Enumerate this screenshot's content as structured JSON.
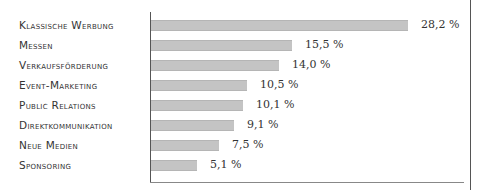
{
  "chart_data": {
    "type": "bar",
    "orientation": "horizontal",
    "title": "",
    "xlabel": "",
    "ylabel": "",
    "unit": "%",
    "categories": [
      "Klassische Werbung",
      "Messen",
      "Verkaufsförderung",
      "Event-Marketing",
      "Public Relations",
      "Direktkommunikation",
      "Neue Medien",
      "Sponsoring"
    ],
    "values": [
      28.2,
      15.5,
      14.0,
      10.5,
      10.1,
      9.1,
      7.5,
      5.1
    ],
    "value_labels": [
      "28,2 %",
      "15,5 %",
      "14,0 %",
      "10,5 %",
      "10,1 %",
      "9,1 %",
      "7,5 %",
      "5,1 %"
    ],
    "xlim": [
      0,
      35
    ],
    "grid": false,
    "legend": null,
    "bar_color": "#c4c4c4"
  },
  "rows": [
    {
      "label": "Klassische Werbung",
      "value": "28,2 %"
    },
    {
      "label": "Messen",
      "value": "15,5 %"
    },
    {
      "label": "Verkaufsförderung",
      "value": "14,0 %"
    },
    {
      "label": "Event-Marketing",
      "value": "10,5 %"
    },
    {
      "label": "Public Relations",
      "value": "10,1 %"
    },
    {
      "label": "Direktkommunikation",
      "value": "9,1 %"
    },
    {
      "label": "Neue Medien",
      "value": "7,5 %"
    },
    {
      "label": "Sponsoring",
      "value": "5,1 %"
    }
  ]
}
